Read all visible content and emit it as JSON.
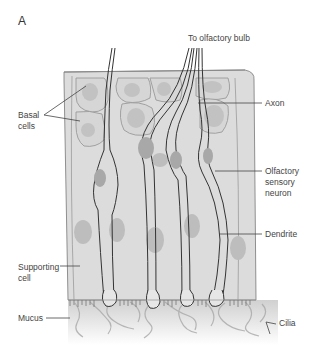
{
  "figure": {
    "panel_label": "A",
    "colors": {
      "tissue": "#dcdcdc",
      "tissue_top": "#d2d2d2",
      "nucleus": "#b8b8b8",
      "outline": "#3a3a3a",
      "cell_border": "#9a9a9a",
      "mucus": "#c8c8c8"
    }
  },
  "labels": {
    "top": "To olfactory bulb",
    "basal_line1": "Basal",
    "basal_line2": "cells",
    "axon": "Axon",
    "osn_line1": "Olfactory",
    "osn_line2": "sensory",
    "osn_line3": "neuron",
    "dendrite": "Dendrite",
    "supporting_line1": "Supporting",
    "supporting_line2": "cell",
    "mucus": "Mucus",
    "cilia": "Cilia"
  }
}
